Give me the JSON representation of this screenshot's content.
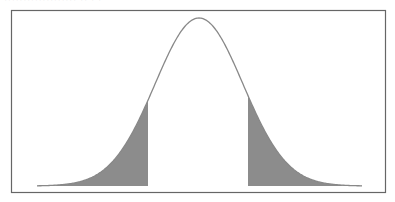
{
  "header": {
    "cut_off_text": "··················· ·· · ·"
  },
  "diagram": {
    "curve": "bell curve",
    "shaded_regions": [
      "left tail",
      "right tail"
    ],
    "colors": {
      "frame": "#666666",
      "curve": "#888888",
      "fill": "#8c8c8c"
    }
  }
}
